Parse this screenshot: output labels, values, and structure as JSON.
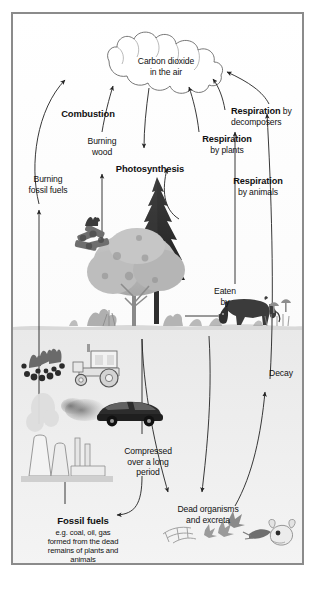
{
  "diagram": {
    "frame_color": "#8b8b8b",
    "background": "#ffffff",
    "ink": "#111111",
    "labels": {
      "atmosphere": "Carbon dioxide\nin the air",
      "atmosphere_line1": "Carbon dioxide",
      "atmosphere_line2": "in the air",
      "combustion": "Combustion",
      "burning_wood_line1": "Burning",
      "burning_wood_line2": "wood",
      "burning_fossil_line1": "Burning",
      "burning_fossil_line2": "fossil fuels",
      "photosynthesis": "Photosynthesis",
      "respiration_plants_bold": "Respiration",
      "respiration_plants_rest": "by plants",
      "respiration_animals_bold": "Respiration",
      "respiration_animals_rest": "by animals",
      "respiration_decomposers_bold": "Respiration",
      "respiration_decomposers_by": " by",
      "respiration_decomposers_rest": "decomposers",
      "eaten_by_line1": "Eaten",
      "eaten_by_line2": "by",
      "decay": "Decay",
      "compressed_line1": "Compressed",
      "compressed_line2": "over a long",
      "compressed_line3": "period",
      "fossil_fuels_bold": "Fossil fuels",
      "fossil_fuels_line1": "e.g. coal, oil, gas",
      "fossil_fuels_line2": "formed from the dead",
      "fossil_fuels_line3": "remains of plants and",
      "fossil_fuels_line4": "animals",
      "dead_organisms_line1": "Dead organisms",
      "dead_organisms_line2": "and excreta"
    },
    "icons": [
      {
        "name": "cloud-icon",
        "label": "carbon dioxide cloud"
      },
      {
        "name": "conifer-tree-icon",
        "label": "conifer tree"
      },
      {
        "name": "deciduous-tree-icon",
        "label": "deciduous tree"
      },
      {
        "name": "campfire-icon",
        "label": "burning wood campfire"
      },
      {
        "name": "cow-icon",
        "label": "grazing cow"
      },
      {
        "name": "mushroom-icon",
        "label": "decomposer mushrooms"
      },
      {
        "name": "tractor-icon",
        "label": "tractor"
      },
      {
        "name": "car-icon",
        "label": "car with exhaust"
      },
      {
        "name": "power-station-icon",
        "label": "power station cooling towers"
      },
      {
        "name": "coal-seam-icon",
        "label": "coal deposit"
      },
      {
        "name": "dead-branch-icon",
        "label": "dead branches"
      },
      {
        "name": "dead-leaf-icon",
        "label": "dead leaves"
      },
      {
        "name": "skull-icon",
        "label": "animal skull"
      },
      {
        "name": "shrub-icon",
        "label": "shrubs and grass"
      }
    ],
    "flows": [
      {
        "name": "burning-fossil-fuels-to-air",
        "from": "power station",
        "to": "carbon dioxide in the air"
      },
      {
        "name": "burning-wood-to-air",
        "from": "campfire",
        "to": "carbon dioxide in the air"
      },
      {
        "name": "photosynthesis-from-air",
        "from": "carbon dioxide in the air",
        "to": "plants"
      },
      {
        "name": "respiration-by-plants-to-air",
        "from": "plants",
        "to": "carbon dioxide in the air"
      },
      {
        "name": "respiration-by-animals-to-air",
        "from": "animals",
        "to": "carbon dioxide in the air"
      },
      {
        "name": "respiration-by-decomposers-to-air",
        "from": "decomposers",
        "to": "carbon dioxide in the air"
      },
      {
        "name": "eaten-by",
        "from": "plants",
        "to": "cow"
      },
      {
        "name": "plants-to-dead-organisms",
        "from": "plants",
        "to": "dead organisms and excreta"
      },
      {
        "name": "animals-to-dead-organisms",
        "from": "animals",
        "to": "dead organisms and excreta"
      },
      {
        "name": "dead-organisms-to-decay",
        "from": "dead organisms and excreta",
        "to": "decay"
      },
      {
        "name": "dead-organisms-to-fossil-fuels",
        "from": "dead organisms",
        "to": "fossil fuels"
      },
      {
        "name": "fossil-fuels-to-power-station",
        "from": "fossil fuels",
        "to": "power station"
      }
    ]
  }
}
